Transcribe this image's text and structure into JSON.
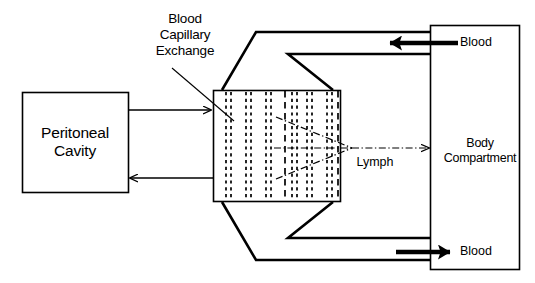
{
  "diagram": {
    "title_text_blocks": {
      "peritoneal_cavity": "Peritoneal\nCavity",
      "blood_capillary_exchange": "Blood\nCapillary\nExchange",
      "body_compartment": "Body\nCompartment",
      "lymph": "Lymph",
      "blood_top": "Blood",
      "blood_bottom": "Blood"
    },
    "colors": {
      "stroke": "#000000",
      "background": "#ffffff",
      "text": "#000000"
    },
    "nodes": [
      {
        "id": "peritoneal-cavity",
        "label": "Peritoneal Cavity",
        "shape": "rectangle",
        "x": 22,
        "y": 92,
        "w": 106,
        "h": 100
      },
      {
        "id": "capillary-membrane",
        "label": "Blood Capillary Exchange membrane",
        "shape": "rectangle-with-dashed-capillaries",
        "x": 213,
        "y": 90,
        "w": 128,
        "h": 112,
        "dashed_pairs": 6,
        "single_dashed_lines": 2
      },
      {
        "id": "body-compartment",
        "label": "Body Compartment",
        "shape": "rectangle",
        "x": 430,
        "y": 25,
        "w": 90,
        "h": 245
      }
    ],
    "connectors": [
      {
        "id": "peritoneal-to-membrane",
        "label": "diffusion into membrane",
        "direction": "right",
        "style": "thin-arrow"
      },
      {
        "id": "membrane-to-peritoneal",
        "label": "diffusion back to cavity",
        "direction": "left",
        "style": "thin-arrow"
      },
      {
        "id": "lymph-flow",
        "label": "Lymph",
        "direction": "right",
        "style": "dash-dot-arrow"
      },
      {
        "id": "blood-inflow",
        "label": "Blood",
        "direction": "left",
        "style": "thick-arrow"
      },
      {
        "id": "blood-outflow",
        "label": "Blood",
        "direction": "right",
        "style": "thick-arrow"
      },
      {
        "id": "vessel-top-outer",
        "label": "blood vessel wall top outer",
        "style": "polyline"
      },
      {
        "id": "vessel-top-inner",
        "label": "blood vessel wall top inner",
        "style": "polyline"
      },
      {
        "id": "vessel-bottom-outer",
        "label": "blood vessel wall bottom outer",
        "style": "polyline"
      },
      {
        "id": "vessel-bottom-inner",
        "label": "blood vessel wall bottom inner",
        "style": "polyline"
      },
      {
        "id": "capillary-pointer",
        "label": "leader line to membrane",
        "style": "thin-line"
      }
    ]
  }
}
